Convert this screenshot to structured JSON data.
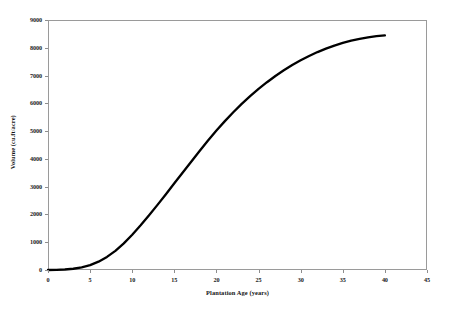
{
  "chart_data": {
    "type": "line",
    "title": "",
    "xlabel": "Plantation Age (years)",
    "ylabel": "Volume (cu.ft/acre)",
    "xlim": [
      0,
      45
    ],
    "ylim": [
      0,
      9000
    ],
    "grid": false,
    "legend": null,
    "x_ticks": [
      "0",
      "5",
      "10",
      "15",
      "20",
      "25",
      "30",
      "35",
      "40",
      "45"
    ],
    "y_ticks": [
      "0",
      "1000",
      "2000",
      "3000",
      "4000",
      "5000",
      "6000",
      "7000",
      "8000",
      "9000"
    ],
    "x_tick_values": [
      0,
      5,
      10,
      15,
      20,
      25,
      30,
      35,
      40,
      45
    ],
    "y_tick_values": [
      0,
      1000,
      2000,
      3000,
      4000,
      5000,
      6000,
      7000,
      8000,
      9000
    ],
    "series": [
      {
        "name": "Volume",
        "color": "#000000",
        "line_width": 2.3,
        "x": [
          0,
          1,
          2,
          3,
          4,
          5,
          6,
          7,
          8,
          9,
          10,
          11,
          12,
          13,
          14,
          15,
          16,
          17,
          18,
          19,
          20,
          21,
          22,
          23,
          24,
          25,
          26,
          27,
          28,
          29,
          30,
          31,
          32,
          33,
          34,
          35,
          36,
          37,
          38,
          39,
          40
        ],
        "values": [
          0,
          5,
          18,
          45,
          95,
          175,
          300,
          470,
          690,
          960,
          1270,
          1610,
          1970,
          2345,
          2730,
          3120,
          3510,
          3900,
          4285,
          4660,
          5020,
          5360,
          5680,
          5980,
          6260,
          6520,
          6760,
          6985,
          7190,
          7380,
          7550,
          7705,
          7845,
          7970,
          8080,
          8175,
          8255,
          8320,
          8375,
          8420,
          8450
        ]
      }
    ]
  }
}
